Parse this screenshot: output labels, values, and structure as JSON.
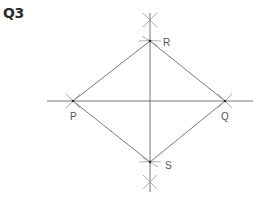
{
  "question": {
    "label": "Q3"
  },
  "diagram": {
    "points": [
      {
        "name": "P",
        "x": 73,
        "y": 101
      },
      {
        "name": "Q",
        "x": 225,
        "y": 101
      },
      {
        "name": "R",
        "x": 150,
        "y": 41
      },
      {
        "name": "S",
        "x": 150,
        "y": 162
      }
    ],
    "labels": {
      "P": "P",
      "Q": "Q",
      "R": "R",
      "S": "S"
    },
    "line_color": "#555555",
    "arc_color": "#999999"
  }
}
